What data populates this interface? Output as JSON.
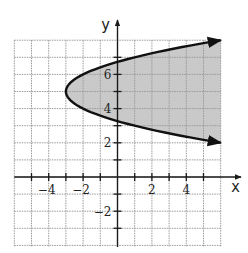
{
  "chart_data": {
    "type": "line",
    "title": "",
    "xlabel": "x",
    "ylabel": "y",
    "xlim": [
      -6,
      6
    ],
    "ylim": [
      -4,
      8
    ],
    "grid": true,
    "x_tick_labels": [
      {
        "value": -4,
        "label": "−4"
      },
      {
        "value": -2,
        "label": "−2"
      },
      {
        "value": 2,
        "label": "2"
      },
      {
        "value": 4,
        "label": "4"
      }
    ],
    "y_tick_labels": [
      {
        "value": 6,
        "label": "6"
      },
      {
        "value": 4,
        "label": "4"
      },
      {
        "value": 2,
        "label": "2"
      },
      {
        "value": -2,
        "label": "−2"
      }
    ],
    "series": [
      {
        "name": "boundary",
        "equation": "x = (y - 5)^2 - 3",
        "vertex": [
          -3,
          5
        ],
        "style": "solid",
        "arrows_at_ends": true,
        "points": [
          [
            6,
            8
          ],
          [
            3.25,
            7.5
          ],
          [
            1,
            7
          ],
          [
            -0.75,
            6.5
          ],
          [
            -2,
            6
          ],
          [
            -2.75,
            5.5
          ],
          [
            -3,
            5
          ],
          [
            -2.75,
            4.5
          ],
          [
            -2,
            4
          ],
          [
            -0.75,
            3.5
          ],
          [
            1,
            3
          ],
          [
            3.25,
            2.5
          ],
          [
            6,
            2
          ]
        ]
      }
    ],
    "shaded_region": {
      "description": "interior of parabola (right side), x > (y - 5)^2 - 3",
      "color": "#c9c9c9"
    }
  },
  "labels": {
    "x_axis": "x",
    "y_axis": "y"
  },
  "colors": {
    "shade": "#c9c9c9",
    "grid": "#9a9a9a",
    "axis": "#1a1a1a",
    "curve": "#111111"
  }
}
